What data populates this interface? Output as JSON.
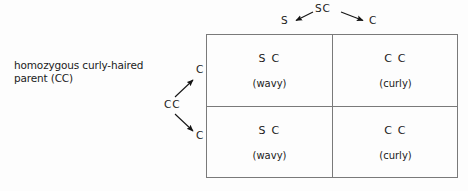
{
  "diagram": {
    "title_text": "Punnett square cross",
    "parent_label": "homozygous curly-haired\nparent (CC)",
    "top_parent": {
      "source_gametes": "SC",
      "gamete_left": "S",
      "gamete_right": "C"
    },
    "left_parent": {
      "source_gametes": "CC",
      "gamete_upper": "C",
      "gamete_lower": "C"
    },
    "grid": {
      "columns": [
        "S",
        "C"
      ],
      "rows": [
        "C",
        "C"
      ],
      "cells": [
        {
          "genotype": "S C",
          "phenotype": "(wavy)"
        },
        {
          "genotype": "C C",
          "phenotype": "(curly)"
        },
        {
          "genotype": "S C",
          "phenotype": "(wavy)"
        },
        {
          "genotype": "C C",
          "phenotype": "(curly)"
        }
      ]
    },
    "colors": {
      "background": "#fdfdfd",
      "line": "#7a7a7a",
      "text": "#1b1b1b",
      "arrow": "#141414"
    }
  }
}
